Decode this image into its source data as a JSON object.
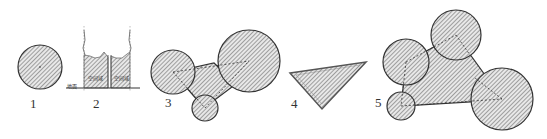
{
  "figures": [
    {
      "id": "1",
      "label": "1",
      "shape": "circle"
    },
    {
      "id": "2",
      "label": "2",
      "shape": "crown-section",
      "ground_label": "地面",
      "zone_labels": [
        "空间域",
        "空间域"
      ]
    },
    {
      "id": "3",
      "label": "3",
      "shape": "three-circles-joined"
    },
    {
      "id": "4",
      "label": "4",
      "shape": "triangle"
    },
    {
      "id": "5",
      "label": "5",
      "shape": "four-circles-joined"
    }
  ],
  "colors": {
    "stroke": "#333333",
    "hatch": "#555555",
    "fill": "#dddddd"
  }
}
